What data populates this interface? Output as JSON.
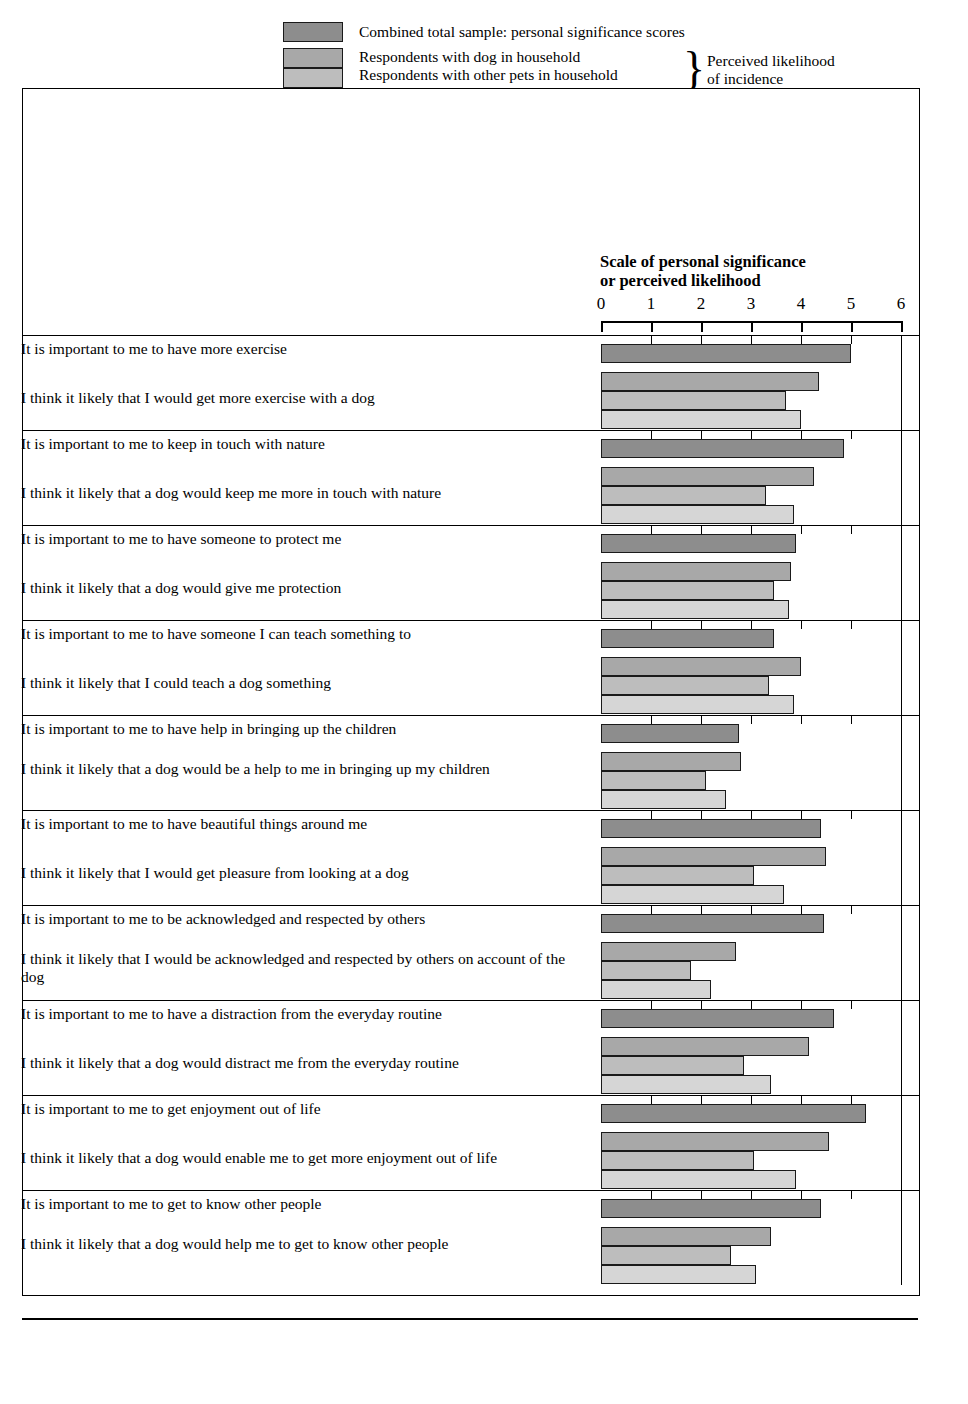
{
  "legend": {
    "total": "Combined total sample: personal significance scores",
    "dog": "Respondents with dog in household",
    "other": "Respondents with other pets in household",
    "none": "Respondents with no pets in household",
    "brace_line1": "Perceived likelihood",
    "brace_line2": "of incidence",
    "brace_glyph": "}",
    "colors": {
      "total": "#8d8d8d",
      "dog": "#a8a8a8",
      "other": "#bdbdbd",
      "none": "#d6d6d6"
    }
  },
  "axis": {
    "title_line1": "Scale of personal significance",
    "title_line2": "or perceived likelihood",
    "ticks": [
      "0",
      "1",
      "2",
      "3",
      "4",
      "5",
      "6"
    ]
  },
  "chart_data": {
    "type": "bar",
    "orientation": "horizontal",
    "title": "Scale of personal significance or perceived likelihood",
    "xlabel": "Scale of personal significance or perceived likelihood",
    "ylabel": "",
    "xlim": [
      0,
      6
    ],
    "xticks": [
      0,
      1,
      2,
      3,
      4,
      5,
      6
    ],
    "grid": false,
    "legend_position": "top",
    "series": [
      {
        "name": "Combined total sample: personal significance scores",
        "color": "#8d8d8d"
      },
      {
        "name": "Respondents with dog in household",
        "color": "#a8a8a8"
      },
      {
        "name": "Respondents with other pets in household",
        "color": "#bdbdbd"
      },
      {
        "name": "Respondents with no pets in household",
        "color": "#d6d6d6"
      }
    ],
    "groups": [
      {
        "significance_label": "It is important to me to have more exercise",
        "likelihood_label": "I think it likely that I would get more exercise with a dog",
        "values": [
          5.0,
          4.35,
          3.7,
          4.0
        ]
      },
      {
        "significance_label": "It is important to me to keep in touch with nature",
        "likelihood_label": "I think it likely that a dog would keep me more in touch with nature",
        "values": [
          4.85,
          4.25,
          3.3,
          3.85
        ]
      },
      {
        "significance_label": "It is important to me to have someone to protect me",
        "likelihood_label": "I think it likely that a dog would give me protection",
        "values": [
          3.9,
          3.8,
          3.45,
          3.75
        ]
      },
      {
        "significance_label": "It is important to me to have someone I can teach something to",
        "likelihood_label": "I think it likely that I could teach a dog something",
        "values": [
          3.45,
          4.0,
          3.35,
          3.85
        ]
      },
      {
        "significance_label": "It is important to me to have help in bringing up the children",
        "likelihood_label": "I think it likely that a dog would be a help to me in bringing up my children",
        "values": [
          2.75,
          2.8,
          2.1,
          2.5
        ]
      },
      {
        "significance_label": "It is important to me to have beautiful things around me",
        "likelihood_label": "I think it likely that I would get pleasure from looking at a dog",
        "values": [
          4.4,
          4.5,
          3.05,
          3.65
        ]
      },
      {
        "significance_label": "It is important to me to be acknowledged and respected by others",
        "likelihood_label": "I think it likely that I would be acknowledged and respected by others on account of the dog",
        "values": [
          4.45,
          2.7,
          1.8,
          2.2
        ]
      },
      {
        "significance_label": "It is important to me to have a distraction from the everyday routine",
        "likelihood_label": "I think it likely that a dog would distract me from the everyday routine",
        "values": [
          4.65,
          4.15,
          2.85,
          3.4
        ]
      },
      {
        "significance_label": "It is important to me to get enjoyment out of life",
        "likelihood_label": "I think it likely that a dog would enable me to get more enjoyment out of life",
        "values": [
          5.3,
          4.55,
          3.05,
          3.9
        ]
      },
      {
        "significance_label": "It is important to me to get to know other people",
        "likelihood_label": "I think it likely that a dog would help me to get to know other people",
        "values": [
          4.4,
          3.4,
          2.6,
          3.1
        ]
      }
    ]
  }
}
